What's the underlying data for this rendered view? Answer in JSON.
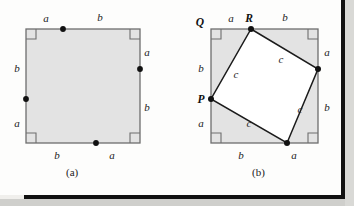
{
  "figure": {
    "title_hidden": "Pythagorean theorem proof by dissection",
    "style": {
      "square_fill": "#e3e3e3",
      "square_stroke": "#6e6e6e",
      "inner_stroke": "#1b1b1b",
      "dot_fill": "#111111",
      "right_angle_stroke": "#6e6e6e",
      "page_background": "#fdfdfc",
      "border_dark": "#111111"
    },
    "panels": [
      {
        "id": "a",
        "caption": "(a)",
        "outer_square": {
          "x": 26,
          "y": 29,
          "size": 114
        },
        "side_labels": [
          {
            "name": "top-left",
            "text": "a",
            "x": 46,
            "y": 22
          },
          {
            "name": "top-right",
            "text": "b",
            "x": 100,
            "y": 21
          },
          {
            "name": "right-upper",
            "text": "a",
            "x": 145,
            "y": 52
          },
          {
            "name": "right-lower",
            "text": "b",
            "x": 145,
            "y": 110
          },
          {
            "name": "left-upper",
            "text": "b",
            "x": 15,
            "y": 68
          },
          {
            "name": "left-lower",
            "text": "a",
            "x": 15,
            "y": 125
          },
          {
            "name": "bottom-left",
            "text": "b",
            "x": 56,
            "y": 158
          },
          {
            "name": "bottom-right",
            "text": "a",
            "x": 111,
            "y": 158
          }
        ],
        "division_points": [
          {
            "name": "top-dot",
            "x": 63,
            "y": 29
          },
          {
            "name": "right-dot",
            "x": 140,
            "y": 69
          },
          {
            "name": "bottom-dot",
            "x": 96,
            "y": 143
          },
          {
            "name": "left-dot",
            "x": 26,
            "y": 99
          }
        ],
        "right_angle_marks": [
          {
            "name": "top-left-corner",
            "x": 26,
            "y": 29,
            "dx": 1,
            "dy": 1
          },
          {
            "name": "top-right-corner",
            "x": 140,
            "y": 29,
            "dx": -1,
            "dy": 1
          },
          {
            "name": "bottom-left-corner",
            "x": 26,
            "y": 143,
            "dx": 1,
            "dy": -1
          },
          {
            "name": "bottom-right-corner",
            "x": 140,
            "y": 143,
            "dx": -1,
            "dy": -1
          }
        ],
        "vertex_labels": []
      },
      {
        "id": "b",
        "caption": "(b)",
        "outer_square": {
          "x": 211,
          "y": 29,
          "size": 107
        },
        "side_labels": [
          {
            "name": "top-left",
            "text": "a",
            "x": 230,
            "y": 22
          },
          {
            "name": "top-right",
            "text": "b",
            "x": 284,
            "y": 21
          },
          {
            "name": "right-upper",
            "text": "a",
            "x": 325,
            "y": 52
          },
          {
            "name": "right-lower",
            "text": "b",
            "x": 325,
            "y": 110
          },
          {
            "name": "left-upper",
            "text": "b",
            "x": 199,
            "y": 68
          },
          {
            "name": "left-lower",
            "text": "a",
            "x": 199,
            "y": 125
          },
          {
            "name": "bottom-left",
            "text": "b",
            "x": 240,
            "y": 158
          },
          {
            "name": "bottom-right",
            "text": "a",
            "x": 293,
            "y": 158
          }
        ],
        "inner_square_vertices": [
          {
            "name": "R",
            "x": 251,
            "y": 29
          },
          {
            "name": "right",
            "x": 318,
            "y": 69
          },
          {
            "name": "bottom",
            "x": 287,
            "y": 143
          },
          {
            "name": "P",
            "x": 211,
            "y": 99
          }
        ],
        "inner_side_labels": [
          {
            "name": "hyp-top-right",
            "text": "c",
            "x": 281,
            "y": 60
          },
          {
            "name": "hyp-right-bottom",
            "text": "c",
            "x": 300,
            "y": 110
          },
          {
            "name": "hyp-bottom-left",
            "text": "c",
            "x": 249,
            "y": 124
          },
          {
            "name": "hyp-left-top",
            "text": "c",
            "x": 235,
            "y": 75
          }
        ],
        "vertex_labels": [
          {
            "name": "Q",
            "text": "Q",
            "x": 199,
            "y": 25
          },
          {
            "name": "R",
            "text": "R",
            "x": 249,
            "y": 21
          },
          {
            "name": "P",
            "text": "P",
            "x": 199,
            "y": 103
          }
        ],
        "right_angle_marks": [
          {
            "name": "top-left-corner",
            "x": 211,
            "y": 29,
            "dx": 1,
            "dy": 1
          },
          {
            "name": "top-right-corner",
            "x": 318,
            "y": 29,
            "dx": -1,
            "dy": 1
          },
          {
            "name": "bottom-left-corner",
            "x": 211,
            "y": 143,
            "dx": 1,
            "dy": -1
          },
          {
            "name": "bottom-right-corner",
            "x": 318,
            "y": 143,
            "dx": -1,
            "dy": -1
          }
        ]
      }
    ]
  }
}
